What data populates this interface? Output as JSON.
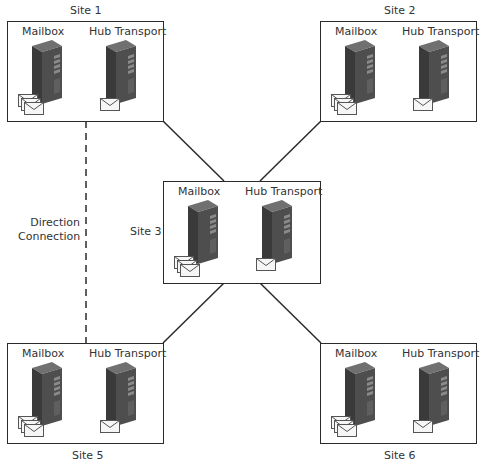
{
  "diagram": {
    "title": "",
    "sites": [
      {
        "id": "site1",
        "label": "Site 1",
        "servers": [
          {
            "label": "Mailbox",
            "type": "mailbox"
          },
          {
            "label": "Hub Transport",
            "type": "hub"
          }
        ]
      },
      {
        "id": "site2",
        "label": "Site 2",
        "servers": [
          {
            "label": "Mailbox",
            "type": "mailbox"
          },
          {
            "label": "Hub Transport",
            "type": "hub"
          }
        ]
      },
      {
        "id": "site3",
        "label": "Site 3",
        "servers": [
          {
            "label": "Mailbox",
            "type": "mailbox"
          },
          {
            "label": "Hub Transport",
            "type": "hub"
          }
        ]
      },
      {
        "id": "site5",
        "label": "Site 5",
        "servers": [
          {
            "label": "Mailbox",
            "type": "mailbox"
          },
          {
            "label": "Hub Transport",
            "type": "hub"
          }
        ]
      },
      {
        "id": "site6",
        "label": "Site 6",
        "servers": [
          {
            "label": "Mailbox",
            "type": "mailbox"
          },
          {
            "label": "Hub Transport",
            "type": "hub"
          }
        ]
      }
    ],
    "connections": [
      {
        "from": "site1",
        "to": "site3",
        "style": "solid"
      },
      {
        "from": "site2",
        "to": "site3",
        "style": "solid"
      },
      {
        "from": "site3",
        "to": "site5",
        "style": "solid"
      },
      {
        "from": "site3",
        "to": "site6",
        "style": "solid"
      },
      {
        "from": "site1",
        "to": "site5",
        "style": "dashed",
        "label_line1": "Direction",
        "label_line2": "Connection"
      }
    ],
    "icons": {
      "server": "server-tower-icon",
      "mail_single": "envelope-icon",
      "mail_stack": "envelope-stack-icon"
    },
    "colors": {
      "line": "#2a2a2a",
      "server_front": "#3c3c3c",
      "server_side": "#5a5a5a",
      "server_top": "#6e6e6e",
      "envelope": "#f4f4f4"
    }
  }
}
